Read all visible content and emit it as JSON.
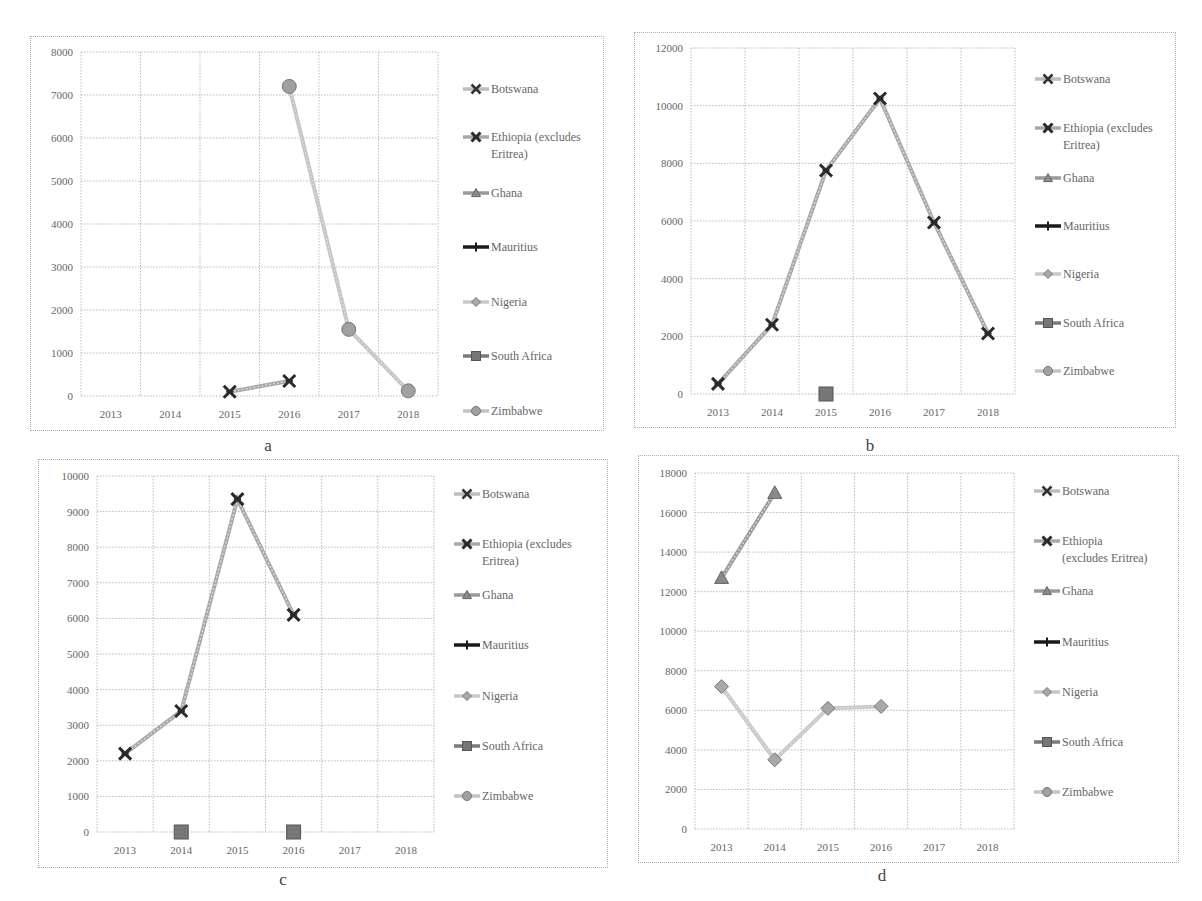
{
  "figure": {
    "panels": [
      {
        "id": "a",
        "label": "a"
      },
      {
        "id": "b",
        "label": "b"
      },
      {
        "id": "c",
        "label": "c"
      },
      {
        "id": "d",
        "label": "d"
      }
    ]
  },
  "legend": {
    "items": [
      {
        "name": "Botswana",
        "lines": [
          "Botswana"
        ],
        "marker": "x",
        "line_color": "#bdbdbd",
        "marker_color": "#333333"
      },
      {
        "name": "Ethiopia (excludes Eritrea)",
        "lines": [
          "Ethiopia (excludes",
          "Eritrea)"
        ],
        "marker": "star",
        "line_color": "#a8a8a8",
        "marker_color": "#2a2a2a"
      },
      {
        "name": "Ghana",
        "lines": [
          "Ghana"
        ],
        "marker": "triangle",
        "line_color": "#9a9a9a",
        "marker_color": "#8a8a8a"
      },
      {
        "name": "Mauritius",
        "lines": [
          "Mauritius"
        ],
        "marker": "plus",
        "line_color": "#1a1a1a",
        "marker_color": "#1a1a1a"
      },
      {
        "name": "Nigeria",
        "lines": [
          "Nigeria"
        ],
        "marker": "diamond",
        "line_color": "#c8c8c8",
        "marker_color": "#a8a8a8"
      },
      {
        "name": "South Africa",
        "lines": [
          "South Africa"
        ],
        "marker": "square",
        "line_color": "#7a7a7a",
        "marker_color": "#777777"
      },
      {
        "name": "Zimbabwe",
        "lines": [
          "Zimbabwe"
        ],
        "marker": "circle",
        "line_color": "#c4c4c4",
        "marker_color": "#a0a0a0"
      }
    ],
    "d_ethiopia_lines": [
      "Ethiopia",
      "(excludes Eritrea)"
    ]
  },
  "chart_data": [
    {
      "panel": "a",
      "type": "line",
      "title": "",
      "xlabel": "",
      "ylabel": "",
      "categories": [
        "2013",
        "2014",
        "2015",
        "2016",
        "2017",
        "2018"
      ],
      "yticks": [
        0,
        1000,
        2000,
        3000,
        4000,
        5000,
        6000,
        7000,
        8000
      ],
      "ylim": [
        0,
        8000
      ],
      "grid": true,
      "legend_position": "right",
      "series": [
        {
          "name": "Botswana",
          "values": [
            null,
            null,
            null,
            null,
            null,
            null
          ]
        },
        {
          "name": "Ethiopia (excludes Eritrea)",
          "values": [
            null,
            null,
            100,
            350,
            null,
            null
          ]
        },
        {
          "name": "Ghana",
          "values": [
            null,
            null,
            null,
            null,
            null,
            null
          ]
        },
        {
          "name": "Mauritius",
          "values": [
            null,
            null,
            null,
            null,
            null,
            null
          ]
        },
        {
          "name": "Nigeria",
          "values": [
            null,
            null,
            null,
            null,
            null,
            null
          ]
        },
        {
          "name": "South Africa",
          "values": [
            null,
            null,
            null,
            null,
            null,
            null
          ]
        },
        {
          "name": "Zimbabwe",
          "values": [
            null,
            null,
            null,
            7200,
            1550,
            120
          ]
        }
      ]
    },
    {
      "panel": "b",
      "type": "line",
      "title": "",
      "xlabel": "",
      "ylabel": "",
      "categories": [
        "2013",
        "2014",
        "2015",
        "2016",
        "2017",
        "2018"
      ],
      "yticks": [
        0,
        2000,
        4000,
        6000,
        8000,
        10000,
        12000
      ],
      "ylim": [
        0,
        12000
      ],
      "grid": true,
      "legend_position": "right",
      "series": [
        {
          "name": "Botswana",
          "values": [
            null,
            null,
            null,
            null,
            null,
            null
          ]
        },
        {
          "name": "Ethiopia (excludes Eritrea)",
          "values": [
            350,
            2400,
            7750,
            10250,
            5950,
            2100
          ]
        },
        {
          "name": "Ghana",
          "values": [
            null,
            null,
            null,
            null,
            null,
            null
          ]
        },
        {
          "name": "Mauritius",
          "values": [
            null,
            null,
            null,
            null,
            null,
            null
          ]
        },
        {
          "name": "Nigeria",
          "values": [
            null,
            null,
            null,
            null,
            null,
            null
          ]
        },
        {
          "name": "South Africa",
          "values": [
            null,
            null,
            0,
            null,
            null,
            null
          ]
        },
        {
          "name": "Zimbabwe",
          "values": [
            null,
            null,
            null,
            null,
            null,
            null
          ]
        }
      ]
    },
    {
      "panel": "c",
      "type": "line",
      "title": "",
      "xlabel": "",
      "ylabel": "",
      "categories": [
        "2013",
        "2014",
        "2015",
        "2016",
        "2017",
        "2018"
      ],
      "yticks": [
        0,
        1000,
        2000,
        3000,
        4000,
        5000,
        6000,
        7000,
        8000,
        9000,
        10000
      ],
      "ylim": [
        0,
        10000
      ],
      "grid": true,
      "legend_position": "right",
      "series": [
        {
          "name": "Botswana",
          "values": [
            null,
            null,
            null,
            null,
            null,
            null
          ]
        },
        {
          "name": "Ethiopia (excludes Eritrea)",
          "values": [
            2200,
            3400,
            9350,
            6100,
            null,
            null
          ]
        },
        {
          "name": "Ghana",
          "values": [
            null,
            null,
            null,
            null,
            null,
            null
          ]
        },
        {
          "name": "Mauritius",
          "values": [
            null,
            null,
            null,
            null,
            null,
            null
          ]
        },
        {
          "name": "Nigeria",
          "values": [
            null,
            null,
            null,
            null,
            null,
            null
          ]
        },
        {
          "name": "South Africa",
          "values": [
            null,
            0,
            null,
            0,
            null,
            null
          ]
        },
        {
          "name": "Zimbabwe",
          "values": [
            null,
            null,
            null,
            null,
            null,
            null
          ]
        }
      ]
    },
    {
      "panel": "d",
      "type": "line",
      "title": "",
      "xlabel": "",
      "ylabel": "",
      "categories": [
        "2013",
        "2014",
        "2015",
        "2016",
        "2017",
        "2018"
      ],
      "yticks": [
        0,
        2000,
        4000,
        6000,
        8000,
        10000,
        12000,
        14000,
        16000,
        18000
      ],
      "ylim": [
        0,
        18000
      ],
      "grid": true,
      "legend_position": "right",
      "series": [
        {
          "name": "Botswana",
          "values": [
            null,
            null,
            null,
            null,
            null,
            null
          ]
        },
        {
          "name": "Ethiopia (excludes Eritrea)",
          "values": [
            null,
            null,
            null,
            null,
            null,
            null
          ]
        },
        {
          "name": "Ghana",
          "values": [
            12700,
            17000,
            null,
            null,
            null,
            null
          ]
        },
        {
          "name": "Mauritius",
          "values": [
            null,
            null,
            null,
            null,
            null,
            null
          ]
        },
        {
          "name": "Nigeria",
          "values": [
            7200,
            3500,
            6100,
            6200,
            null,
            null
          ]
        },
        {
          "name": "South Africa",
          "values": [
            null,
            null,
            null,
            null,
            null,
            null
          ]
        },
        {
          "name": "Zimbabwe",
          "values": [
            null,
            null,
            null,
            null,
            null,
            null
          ]
        }
      ]
    }
  ]
}
